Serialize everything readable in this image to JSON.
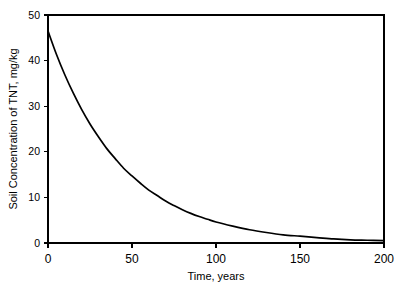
{
  "chart_data": {
    "type": "line",
    "title": "",
    "xlabel": "Time, years",
    "ylabel": "Soil Concentration of TNT, mg/kg",
    "xlim": [
      0,
      200
    ],
    "ylim": [
      0,
      50
    ],
    "xticks": [
      0,
      50,
      100,
      150,
      200
    ],
    "yticks": [
      0,
      10,
      20,
      30,
      40,
      50
    ],
    "xtick_labels": [
      "0",
      "50",
      "100",
      "150",
      "200"
    ],
    "ytick_labels": [
      "0",
      "10",
      "20",
      "30",
      "40",
      "50"
    ],
    "grid": false,
    "legend": null,
    "series": [
      {
        "name": "Soil Concentration of TNT",
        "x": [
          0,
          5,
          10,
          15,
          20,
          25,
          30,
          35,
          40,
          45,
          50,
          55,
          60,
          65,
          70,
          75,
          80,
          85,
          90,
          95,
          100,
          110,
          120,
          130,
          140,
          150,
          160,
          170,
          180,
          190,
          200
        ],
        "values": [
          46.5,
          41.4,
          36.9,
          32.9,
          29.3,
          26.1,
          23.3,
          20.7,
          18.5,
          16.4,
          14.7,
          13.1,
          11.6,
          10.4,
          9.2,
          8.2,
          7.3,
          6.5,
          5.8,
          5.2,
          4.6,
          3.7,
          2.9,
          2.3,
          1.8,
          1.5,
          1.2,
          0.9,
          0.7,
          0.6,
          0.5
        ]
      }
    ],
    "annotations": [],
    "colors": {
      "curve": "#000000",
      "axis": "#000000",
      "background": "#ffffff"
    }
  }
}
